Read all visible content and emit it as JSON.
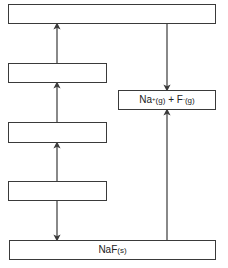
{
  "diagram": {
    "colors": {
      "line": "#3a3a3a",
      "box_border": "#3a3a3a",
      "background": "#ffffff",
      "text": "#222222"
    },
    "boxes": [
      {
        "id": "top-level",
        "label": ""
      },
      {
        "id": "left-level-2",
        "label": ""
      },
      {
        "id": "left-level-3",
        "label": ""
      },
      {
        "id": "left-level-4",
        "label": ""
      },
      {
        "id": "gaseous-ions",
        "species": [
          {
            "symbol": "Na",
            "charge": "+",
            "state": "(g)"
          },
          {
            "symbol": "F",
            "charge": "-",
            "state": "(g)"
          }
        ],
        "joiner": " + "
      },
      {
        "id": "solid-compound",
        "symbol": "NaF",
        "state": "(s)"
      }
    ],
    "arrows": [
      {
        "from": "left-level-2",
        "to": "top-level",
        "direction": "up"
      },
      {
        "from": "left-level-3",
        "to": "left-level-2",
        "direction": "up"
      },
      {
        "from": "left-level-4",
        "to": "left-level-3",
        "direction": "up"
      },
      {
        "from": "left-level-4",
        "to": "solid-compound",
        "direction": "down"
      },
      {
        "from": "top-level",
        "to": "gaseous-ions",
        "direction": "down"
      },
      {
        "from": "solid-compound",
        "to": "gaseous-ions",
        "direction": "up"
      }
    ]
  }
}
